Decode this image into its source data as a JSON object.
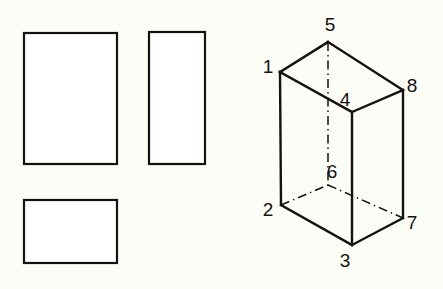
{
  "canvas": {
    "width": 443,
    "height": 289,
    "background_color": "#fdfdf8",
    "line_color": "#14110f",
    "fill_color": "#ffffff"
  },
  "orthographic_views": {
    "rectangles": [
      {
        "name": "front-view",
        "x": 24,
        "y": 33,
        "width": 93,
        "height": 131
      },
      {
        "name": "side-view",
        "x": 149,
        "y": 32,
        "width": 56,
        "height": 132
      },
      {
        "name": "top-view",
        "x": 24,
        "y": 200,
        "width": 93,
        "height": 63
      }
    ]
  },
  "isometric_box": {
    "vertices": [
      {
        "id": "1",
        "label": "1",
        "x": 280,
        "y": 72,
        "label_x": 268,
        "label_y": 68,
        "hidden": false
      },
      {
        "id": "2",
        "label": "2",
        "x": 281,
        "y": 205,
        "label_x": 268,
        "label_y": 211,
        "hidden": false
      },
      {
        "id": "3",
        "label": "3",
        "x": 352,
        "y": 245,
        "label_x": 345,
        "label_y": 262,
        "hidden": false
      },
      {
        "id": "4",
        "label": "4",
        "x": 352,
        "y": 112,
        "label_x": 345,
        "label_y": 101,
        "hidden": false
      },
      {
        "id": "5",
        "label": "5",
        "x": 328,
        "y": 42,
        "label_x": 330,
        "label_y": 26,
        "hidden": false
      },
      {
        "id": "6",
        "label": "6",
        "x": 328,
        "y": 185,
        "label_x": 332,
        "label_y": 173,
        "hidden": true
      },
      {
        "id": "7",
        "label": "7",
        "x": 403,
        "y": 218,
        "label_x": 412,
        "label_y": 224,
        "hidden": false
      },
      {
        "id": "8",
        "label": "8",
        "x": 403,
        "y": 90,
        "label_x": 412,
        "label_y": 87,
        "hidden": false
      }
    ],
    "solid_edges": [
      {
        "name": "edge-1-5",
        "from": "1",
        "to": "5"
      },
      {
        "name": "edge-5-8",
        "from": "5",
        "to": "8"
      },
      {
        "name": "edge-1-4",
        "from": "1",
        "to": "4"
      },
      {
        "name": "edge-4-8",
        "from": "4",
        "to": "8"
      },
      {
        "name": "edge-1-2",
        "from": "1",
        "to": "2"
      },
      {
        "name": "edge-4-3",
        "from": "4",
        "to": "3"
      },
      {
        "name": "edge-8-7",
        "from": "8",
        "to": "7"
      },
      {
        "name": "edge-2-3",
        "from": "2",
        "to": "3"
      },
      {
        "name": "edge-3-7",
        "from": "3",
        "to": "7"
      }
    ],
    "hidden_edges": [
      {
        "name": "hidden-edge-5-6",
        "from": "5",
        "to": "6"
      },
      {
        "name": "hidden-edge-2-6",
        "from": "2",
        "to": "6"
      },
      {
        "name": "hidden-edge-6-7",
        "from": "6",
        "to": "7"
      }
    ]
  }
}
